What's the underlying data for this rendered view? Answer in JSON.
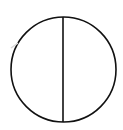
{
  "diagram": {
    "shape": "circle-divided-vertically",
    "circle": {
      "cx": 63.5,
      "cy": 69.5,
      "r": 52.5,
      "stroke": "#111111",
      "stroke_width": 1.6,
      "fill": "#ffffff"
    },
    "divider": {
      "x": 63,
      "y1": 17,
      "y2": 122,
      "stroke": "#111111",
      "stroke_width": 1.6
    },
    "halves": [
      "left-half",
      "right-half"
    ],
    "background": "#ffffff"
  }
}
